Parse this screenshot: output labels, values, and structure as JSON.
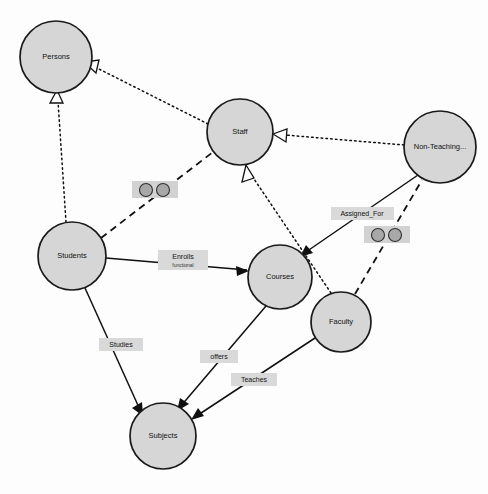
{
  "diagram": {
    "background_color": "#fdfdfd",
    "node_fill_color": "#d6d6d6",
    "node_stroke_color": "#1a1a1a",
    "label_box_color": "#d9d9d9",
    "nodes": [
      {
        "id": "persons",
        "label": "Persons",
        "cx": 56,
        "cy": 57,
        "r": 36
      },
      {
        "id": "staff",
        "label": "Staff",
        "cx": 240,
        "cy": 132,
        "r": 33
      },
      {
        "id": "nonteaching",
        "label": "Non-Teaching...",
        "cx": 440,
        "cy": 147,
        "r": 36
      },
      {
        "id": "students",
        "label": "Students",
        "cx": 72,
        "cy": 256,
        "r": 34
      },
      {
        "id": "courses",
        "label": "Courses",
        "cx": 280,
        "cy": 277,
        "r": 32
      },
      {
        "id": "faculty",
        "label": "Faculty",
        "cx": 341,
        "cy": 322,
        "r": 30
      },
      {
        "id": "subjects",
        "label": "Subjects",
        "cx": 163,
        "cy": 436,
        "r": 33
      }
    ],
    "edges": [
      {
        "id": "staff-persons",
        "from": "staff",
        "to": "persons",
        "style": "dotted",
        "arrow": "hollow",
        "label": ""
      },
      {
        "id": "students-persons",
        "from": "students",
        "to": "persons",
        "style": "dotted",
        "arrow": "hollow",
        "label": ""
      },
      {
        "id": "nonteaching-staff",
        "from": "nonteaching",
        "to": "staff",
        "style": "dotted",
        "arrow": "hollow",
        "label": ""
      },
      {
        "id": "faculty-staff",
        "from": "faculty",
        "to": "staff",
        "style": "dotted",
        "arrow": "hollow",
        "label": ""
      },
      {
        "id": "students-staff",
        "from": "students",
        "to": "staff",
        "style": "dashed",
        "arrow": "none",
        "label": ""
      },
      {
        "id": "faculty-nonteaching",
        "from": "faculty",
        "to": "nonteaching",
        "style": "dashed",
        "arrow": "none",
        "label": ""
      },
      {
        "id": "students-courses",
        "from": "students",
        "to": "courses",
        "style": "solid",
        "arrow": "solid",
        "label": "Enrolls",
        "sublabel": "functional"
      },
      {
        "id": "nonteaching-courses",
        "from": "nonteaching",
        "to": "courses",
        "style": "solid",
        "arrow": "solid",
        "label": "Assigned_For"
      },
      {
        "id": "students-subjects",
        "from": "students",
        "to": "subjects",
        "style": "solid",
        "arrow": "solid",
        "label": "Studies"
      },
      {
        "id": "courses-subjects",
        "from": "courses",
        "to": "subjects",
        "style": "solid",
        "arrow": "solid",
        "label": "offers"
      },
      {
        "id": "faculty-subjects",
        "from": "faculty",
        "to": "subjects",
        "style": "solid",
        "arrow": "solid",
        "label": "Teaches"
      }
    ],
    "edge_labels": [
      {
        "id": "label-enrolls",
        "text": "Enrolls",
        "subtext": "functional",
        "x": 183,
        "y": 260,
        "w": 50,
        "h": 19
      },
      {
        "id": "label-assigned-for",
        "text": "Assigned_For",
        "subtext": "",
        "x": 331,
        "y": 207,
        "w": 63,
        "h": 13
      },
      {
        "id": "label-studies",
        "text": "Studies",
        "subtext": "",
        "x": 99,
        "y": 338,
        "w": 44,
        "h": 13
      },
      {
        "id": "label-offers",
        "text": "offers",
        "subtext": "",
        "x": 200,
        "y": 350,
        "w": 38,
        "h": 13
      },
      {
        "id": "label-teaches",
        "text": "Teaches",
        "subtext": "",
        "x": 231,
        "y": 373,
        "w": 46,
        "h": 13
      }
    ],
    "cardinality_markers": [
      {
        "id": "marker-students-staff",
        "x": 132,
        "y": 181,
        "w": 46,
        "h": 17
      },
      {
        "id": "marker-faculty-nonteaching",
        "x": 364,
        "y": 226,
        "w": 46,
        "h": 17
      }
    ]
  }
}
